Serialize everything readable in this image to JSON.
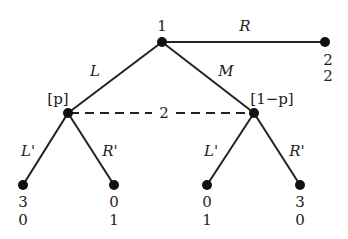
{
  "diagram": {
    "type": "extensive-form-game-tree",
    "root": {
      "player": "1",
      "x": 162,
      "y": 42
    },
    "actions_root": [
      "L",
      "M",
      "R"
    ],
    "info_set": {
      "player": "2",
      "beliefs": [
        "[p]",
        "[1−p]"
      ]
    },
    "actions_player2": [
      "L'",
      "R'",
      "L'",
      "R'"
    ],
    "payoffs": {
      "R": [
        "2",
        "2"
      ],
      "L_L'": [
        "3",
        "0"
      ],
      "L_R'": [
        "0",
        "1"
      ],
      "M_L'": [
        "0",
        "1"
      ],
      "M_R'": [
        "3",
        "0"
      ]
    }
  }
}
